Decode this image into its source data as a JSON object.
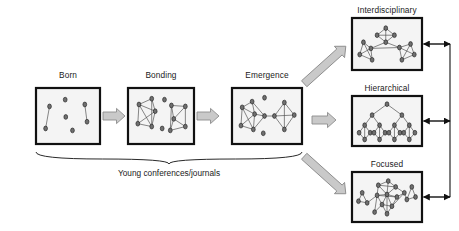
{
  "figure": {
    "kind": "network-evolution-diagram",
    "caption": "Young conferences/journals",
    "colors": {
      "panel_border": "#111111",
      "panel_fill": "#f4f4f4",
      "node_fill": "#6f6f6f",
      "node_stroke": "#1a1a1a",
      "edge": "#555555",
      "block_arrow_fill": "#c9c9c9",
      "block_arrow_stroke": "#8c8c8c",
      "connector": "#111111",
      "text": "#1a1a1a"
    }
  },
  "stages": [
    {
      "id": "born",
      "label": "Born",
      "box": {
        "x": 36,
        "y": 88,
        "w": 64,
        "h": 56
      },
      "label_pos": {
        "x": 36,
        "y": 70,
        "w": 64
      },
      "nodes": [
        {
          "x": 0.17,
          "y": 0.3
        },
        {
          "x": 0.45,
          "y": 0.16
        },
        {
          "x": 0.8,
          "y": 0.26
        },
        {
          "x": 0.1,
          "y": 0.76
        },
        {
          "x": 0.46,
          "y": 0.52
        },
        {
          "x": 0.58,
          "y": 0.8
        },
        {
          "x": 0.84,
          "y": 0.62
        }
      ],
      "edges": [
        [
          0,
          3
        ],
        [
          2,
          6
        ]
      ]
    },
    {
      "id": "bonding",
      "label": "Bonding",
      "box": {
        "x": 128,
        "y": 88,
        "w": 66,
        "h": 56
      },
      "label_pos": {
        "x": 123,
        "y": 70,
        "w": 76
      },
      "nodes": [
        {
          "x": 0.12,
          "y": 0.26
        },
        {
          "x": 0.34,
          "y": 0.14
        },
        {
          "x": 0.4,
          "y": 0.4
        },
        {
          "x": 0.1,
          "y": 0.66
        },
        {
          "x": 0.34,
          "y": 0.72
        },
        {
          "x": 0.56,
          "y": 0.16
        },
        {
          "x": 0.52,
          "y": 0.76
        },
        {
          "x": 0.68,
          "y": 0.28
        },
        {
          "x": 0.92,
          "y": 0.3
        },
        {
          "x": 0.72,
          "y": 0.56
        },
        {
          "x": 0.66,
          "y": 0.8
        },
        {
          "x": 0.92,
          "y": 0.72
        }
      ],
      "edges": [
        [
          0,
          1
        ],
        [
          0,
          2
        ],
        [
          0,
          3
        ],
        [
          0,
          4
        ],
        [
          1,
          2
        ],
        [
          2,
          3
        ],
        [
          2,
          4
        ],
        [
          3,
          4
        ],
        [
          1,
          4
        ],
        [
          7,
          8
        ],
        [
          7,
          9
        ],
        [
          7,
          10
        ],
        [
          8,
          9
        ],
        [
          8,
          11
        ],
        [
          9,
          10
        ],
        [
          9,
          11
        ],
        [
          10,
          11
        ]
      ]
    },
    {
      "id": "emergence",
      "label": "Emergence",
      "box": {
        "x": 232,
        "y": 88,
        "w": 70,
        "h": 56
      },
      "label_pos": {
        "x": 225,
        "y": 70,
        "w": 84
      },
      "nodes": [
        {
          "x": 0.1,
          "y": 0.32
        },
        {
          "x": 0.26,
          "y": 0.2
        },
        {
          "x": 0.3,
          "y": 0.46
        },
        {
          "x": 0.08,
          "y": 0.7
        },
        {
          "x": 0.28,
          "y": 0.78
        },
        {
          "x": 0.46,
          "y": 0.5
        },
        {
          "x": 0.62,
          "y": 0.5
        },
        {
          "x": 0.78,
          "y": 0.22
        },
        {
          "x": 0.94,
          "y": 0.48
        },
        {
          "x": 0.78,
          "y": 0.78
        },
        {
          "x": 0.46,
          "y": 0.12
        },
        {
          "x": 0.44,
          "y": 0.86
        }
      ],
      "edges": [
        [
          0,
          1
        ],
        [
          0,
          2
        ],
        [
          0,
          3
        ],
        [
          0,
          4
        ],
        [
          1,
          2
        ],
        [
          2,
          3
        ],
        [
          2,
          4
        ],
        [
          3,
          4
        ],
        [
          2,
          5
        ],
        [
          1,
          5
        ],
        [
          4,
          5
        ],
        [
          5,
          6
        ],
        [
          6,
          7
        ],
        [
          6,
          8
        ],
        [
          6,
          9
        ],
        [
          7,
          8
        ],
        [
          8,
          9
        ],
        [
          7,
          9
        ]
      ]
    }
  ],
  "outcomes": [
    {
      "id": "interdisciplinary",
      "label": "Interdisciplinary",
      "box": {
        "x": 352,
        "y": 18,
        "w": 70,
        "h": 52
      },
      "label_pos": {
        "x": 340,
        "y": 5,
        "w": 94
      },
      "nodes": [
        {
          "x": 0.48,
          "y": 0.14
        },
        {
          "x": 0.34,
          "y": 0.3
        },
        {
          "x": 0.62,
          "y": 0.3
        },
        {
          "x": 0.48,
          "y": 0.46
        },
        {
          "x": 0.12,
          "y": 0.46
        },
        {
          "x": 0.06,
          "y": 0.74
        },
        {
          "x": 0.24,
          "y": 0.6
        },
        {
          "x": 0.26,
          "y": 0.86
        },
        {
          "x": 0.7,
          "y": 0.58
        },
        {
          "x": 0.88,
          "y": 0.5
        },
        {
          "x": 0.94,
          "y": 0.74
        },
        {
          "x": 0.74,
          "y": 0.86
        }
      ],
      "edges": [
        [
          0,
          1
        ],
        [
          0,
          2
        ],
        [
          1,
          2
        ],
        [
          1,
          3
        ],
        [
          2,
          3
        ],
        [
          0,
          3
        ],
        [
          4,
          5
        ],
        [
          4,
          6
        ],
        [
          4,
          7
        ],
        [
          5,
          6
        ],
        [
          5,
          7
        ],
        [
          6,
          7
        ],
        [
          8,
          9
        ],
        [
          8,
          10
        ],
        [
          8,
          11
        ],
        [
          9,
          10
        ],
        [
          10,
          11
        ],
        [
          9,
          11
        ],
        [
          3,
          6
        ],
        [
          3,
          8
        ],
        [
          6,
          8
        ]
      ]
    },
    {
      "id": "hierarchical",
      "label": "Hierarchical",
      "box": {
        "x": 352,
        "y": 96,
        "w": 70,
        "h": 50
      },
      "label_pos": {
        "x": 348,
        "y": 83,
        "w": 78
      },
      "tree": {
        "levels": [
          [
            {
              "x": 0.5,
              "y": 0.1
            }
          ],
          [
            {
              "x": 0.26,
              "y": 0.36
            },
            {
              "x": 0.74,
              "y": 0.36
            }
          ],
          [
            {
              "x": 0.14,
              "y": 0.6
            },
            {
              "x": 0.38,
              "y": 0.6
            },
            {
              "x": 0.62,
              "y": 0.6
            },
            {
              "x": 0.86,
              "y": 0.6
            }
          ],
          [
            {
              "x": 0.05,
              "y": 0.78
            },
            {
              "x": 0.23,
              "y": 0.78
            },
            {
              "x": 0.29,
              "y": 0.78
            },
            {
              "x": 0.47,
              "y": 0.78
            },
            {
              "x": 0.53,
              "y": 0.78
            },
            {
              "x": 0.71,
              "y": 0.78
            },
            {
              "x": 0.77,
              "y": 0.78
            },
            {
              "x": 0.95,
              "y": 0.78
            }
          ],
          [
            {
              "x": 0.14,
              "y": 0.94
            },
            {
              "x": 0.38,
              "y": 0.94
            },
            {
              "x": 0.62,
              "y": 0.94
            },
            {
              "x": 0.86,
              "y": 0.94
            }
          ]
        ]
      }
    },
    {
      "id": "focused",
      "label": "Focused",
      "box": {
        "x": 352,
        "y": 172,
        "w": 70,
        "h": 50
      },
      "label_pos": {
        "x": 352,
        "y": 159,
        "w": 70
      },
      "nodes": [
        {
          "x": 0.36,
          "y": 0.22
        },
        {
          "x": 0.52,
          "y": 0.12
        },
        {
          "x": 0.64,
          "y": 0.26
        },
        {
          "x": 0.34,
          "y": 0.46
        },
        {
          "x": 0.5,
          "y": 0.44
        },
        {
          "x": 0.66,
          "y": 0.5
        },
        {
          "x": 0.42,
          "y": 0.68
        },
        {
          "x": 0.58,
          "y": 0.72
        },
        {
          "x": 0.5,
          "y": 0.9
        },
        {
          "x": 0.3,
          "y": 0.86
        },
        {
          "x": 0.78,
          "y": 0.4
        },
        {
          "x": 0.1,
          "y": 0.4
        },
        {
          "x": 0.04,
          "y": 0.6
        },
        {
          "x": 0.18,
          "y": 0.64
        },
        {
          "x": 0.9,
          "y": 0.26
        },
        {
          "x": 0.96,
          "y": 0.5
        },
        {
          "x": 0.82,
          "y": 0.56
        }
      ],
      "edges": [
        [
          0,
          1
        ],
        [
          0,
          3
        ],
        [
          0,
          4
        ],
        [
          1,
          2
        ],
        [
          1,
          4
        ],
        [
          2,
          4
        ],
        [
          2,
          10
        ],
        [
          3,
          4
        ],
        [
          3,
          6
        ],
        [
          3,
          9
        ],
        [
          4,
          5
        ],
        [
          4,
          6
        ],
        [
          4,
          7
        ],
        [
          5,
          7
        ],
        [
          5,
          10
        ],
        [
          6,
          7
        ],
        [
          6,
          8
        ],
        [
          6,
          9
        ],
        [
          7,
          8
        ],
        [
          7,
          10
        ],
        [
          0,
          2
        ],
        [
          3,
          5
        ],
        [
          4,
          8
        ],
        [
          11,
          12
        ],
        [
          11,
          13
        ],
        [
          12,
          13
        ],
        [
          13,
          3
        ],
        [
          14,
          15
        ],
        [
          14,
          16
        ],
        [
          15,
          16
        ],
        [
          16,
          10
        ]
      ]
    }
  ],
  "connectors": {
    "stage_arrows": [
      {
        "from": "born",
        "to": "bonding",
        "x": 104,
        "y": 116
      },
      {
        "from": "bonding",
        "to": "emergence",
        "x": 198,
        "y": 116
      }
    ],
    "fanout_arrows": [
      {
        "to": "interdisciplinary",
        "angle": -42
      },
      {
        "to": "hierarchical",
        "angle": 0
      },
      {
        "to": "focused",
        "angle": 42
      }
    ],
    "bidirectional_links": [
      {
        "panel": "interdisciplinary",
        "y": 44
      },
      {
        "panel": "hierarchical",
        "y": 121
      },
      {
        "panel": "focused",
        "y": 197
      }
    ],
    "bus_x": 450,
    "brace": {
      "x1": 36,
      "x2": 302,
      "y": 152,
      "tip_x": 169,
      "tip_y": 164
    }
  }
}
